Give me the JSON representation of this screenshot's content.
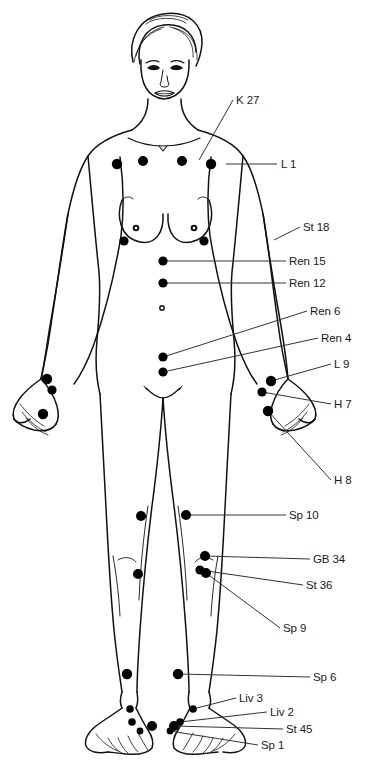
{
  "figure": {
    "background_color": "#ffffff",
    "line_color": "#111111",
    "point_color": "#000000",
    "leader_color": "#333333",
    "view": "anterior"
  },
  "labels": [
    {
      "id": "k27",
      "text": "K 27",
      "x": 236,
      "y": 104,
      "anchor": "start"
    },
    {
      "id": "l1",
      "text": "L 1",
      "x": 281,
      "y": 168,
      "anchor": "start"
    },
    {
      "id": "st18",
      "text": "St 18",
      "x": 303,
      "y": 231,
      "anchor": "start"
    },
    {
      "id": "ren15",
      "text": "Ren 15",
      "x": 289,
      "y": 265,
      "anchor": "start"
    },
    {
      "id": "ren12",
      "text": "Ren 12",
      "x": 289,
      "y": 287,
      "anchor": "start"
    },
    {
      "id": "ren6",
      "text": "Ren 6",
      "x": 310,
      "y": 315,
      "anchor": "start"
    },
    {
      "id": "ren4",
      "text": "Ren 4",
      "x": 321,
      "y": 342,
      "anchor": "start"
    },
    {
      "id": "l9",
      "text": "L 9",
      "x": 334,
      "y": 368,
      "anchor": "start"
    },
    {
      "id": "h7",
      "text": "H 7",
      "x": 334,
      "y": 408,
      "anchor": "start"
    },
    {
      "id": "h8",
      "text": "H 8",
      "x": 334,
      "y": 484,
      "anchor": "start"
    },
    {
      "id": "sp10",
      "text": "Sp 10",
      "x": 289,
      "y": 519,
      "anchor": "start"
    },
    {
      "id": "gb34",
      "text": "GB 34",
      "x": 313,
      "y": 563,
      "anchor": "start"
    },
    {
      "id": "st36",
      "text": "St 36",
      "x": 306,
      "y": 589,
      "anchor": "start"
    },
    {
      "id": "sp9",
      "text": "Sp 9",
      "x": 283,
      "y": 632,
      "anchor": "start"
    },
    {
      "id": "sp6",
      "text": "Sp 6",
      "x": 313,
      "y": 681,
      "anchor": "start"
    },
    {
      "id": "liv3",
      "text": "Liv 3",
      "x": 239,
      "y": 702,
      "anchor": "start"
    },
    {
      "id": "liv2",
      "text": "Liv 2",
      "x": 270,
      "y": 716,
      "anchor": "start"
    },
    {
      "id": "st45",
      "text": "St 45",
      "x": 286,
      "y": 733,
      "anchor": "start"
    },
    {
      "id": "sp1",
      "text": "Sp 1",
      "x": 261,
      "y": 749,
      "anchor": "start"
    }
  ],
  "leaders": [
    {
      "id": "k27",
      "path": "M233,100 L199,160"
    },
    {
      "id": "l1",
      "path": "M277,164 L226,164"
    },
    {
      "id": "st18",
      "path": "M300,227 L274,240"
    },
    {
      "id": "ren15",
      "path": "M286,261 L163,261"
    },
    {
      "id": "ren12",
      "path": "M286,283 L163,283"
    },
    {
      "id": "ren6",
      "path": "M307,311 L163,357"
    },
    {
      "id": "ren4",
      "path": "M318,338 L163,372"
    },
    {
      "id": "l9",
      "path": "M331,364 L271,381"
    },
    {
      "id": "h7",
      "path": "M331,404 L262,392"
    },
    {
      "id": "h8",
      "path": "M331,480 L268,411"
    },
    {
      "id": "sp10",
      "path": "M286,515 L186,515"
    },
    {
      "id": "gb34",
      "path": "M310,559 L205,556"
    },
    {
      "id": "st36",
      "path": "M303,585 L200,570"
    },
    {
      "id": "sp9",
      "path": "M280,628 L206,573"
    },
    {
      "id": "sp6",
      "path": "M310,677 L178,674"
    },
    {
      "id": "liv3",
      "path": "M236,698 L193,709"
    },
    {
      "id": "liv2",
      "path": "M267,712 L180,722"
    },
    {
      "id": "st45",
      "path": "M283,729 L174,726"
    },
    {
      "id": "sp1",
      "path": "M258,745 L170,731"
    }
  ],
  "points": [
    {
      "id": "k27-left",
      "cx": 143,
      "cy": 161,
      "r": 5.0
    },
    {
      "id": "k27-right",
      "cx": 182,
      "cy": 161,
      "r": 5.0
    },
    {
      "id": "l1-left",
      "cx": 117,
      "cy": 164,
      "r": 5.2
    },
    {
      "id": "l1-right",
      "cx": 211,
      "cy": 164,
      "r": 5.2
    },
    {
      "id": "st18-left",
      "cx": 124,
      "cy": 241,
      "r": 4.6
    },
    {
      "id": "st18-right",
      "cx": 204,
      "cy": 241,
      "r": 4.6
    },
    {
      "id": "ren15",
      "cx": 163,
      "cy": 261,
      "r": 4.6
    },
    {
      "id": "ren12",
      "cx": 163,
      "cy": 283,
      "r": 4.6
    },
    {
      "id": "ren6",
      "cx": 163,
      "cy": 357,
      "r": 4.6
    },
    {
      "id": "ren4",
      "cx": 163,
      "cy": 372,
      "r": 4.6
    },
    {
      "id": "l9-right",
      "cx": 271,
      "cy": 381,
      "r": 5.2
    },
    {
      "id": "l9-left",
      "cx": 47,
      "cy": 379,
      "r": 5.2
    },
    {
      "id": "h7-right",
      "cx": 262,
      "cy": 392,
      "r": 4.6
    },
    {
      "id": "h7-left",
      "cx": 52,
      "cy": 390,
      "r": 4.6
    },
    {
      "id": "h8-right",
      "cx": 268,
      "cy": 411,
      "r": 5.2
    },
    {
      "id": "h8-left",
      "cx": 43,
      "cy": 414,
      "r": 5.2
    },
    {
      "id": "sp10-left",
      "cx": 141,
      "cy": 516,
      "r": 5.0
    },
    {
      "id": "sp10-right",
      "cx": 186,
      "cy": 515,
      "r": 5.0
    },
    {
      "id": "gb34",
      "cx": 205,
      "cy": 556,
      "r": 5.0
    },
    {
      "id": "st36",
      "cx": 200,
      "cy": 570,
      "r": 4.6
    },
    {
      "id": "sp9-left",
      "cx": 138,
      "cy": 574,
      "r": 5.0
    },
    {
      "id": "sp9-right",
      "cx": 206,
      "cy": 573,
      "r": 5.0
    },
    {
      "id": "sp6-left",
      "cx": 127,
      "cy": 674,
      "r": 5.2
    },
    {
      "id": "sp6-right",
      "cx": 178,
      "cy": 674,
      "r": 5.2
    },
    {
      "id": "liv3-left",
      "cx": 130,
      "cy": 709,
      "r": 3.8
    },
    {
      "id": "liv3-right",
      "cx": 193,
      "cy": 709,
      "r": 3.8
    },
    {
      "id": "liv2-left",
      "cx": 132,
      "cy": 722,
      "r": 3.8
    },
    {
      "id": "liv2-right",
      "cx": 180,
      "cy": 722,
      "r": 3.8
    },
    {
      "id": "st45-left",
      "cx": 152,
      "cy": 726,
      "r": 5.0
    },
    {
      "id": "st45-right",
      "cx": 174,
      "cy": 726,
      "r": 5.0
    },
    {
      "id": "sp1-left",
      "cx": 140,
      "cy": 731,
      "r": 3.4
    },
    {
      "id": "sp1-right",
      "cx": 170,
      "cy": 731,
      "r": 3.4
    },
    {
      "id": "navel",
      "cx": 162,
      "cy": 308,
      "r": 2.2
    }
  ]
}
